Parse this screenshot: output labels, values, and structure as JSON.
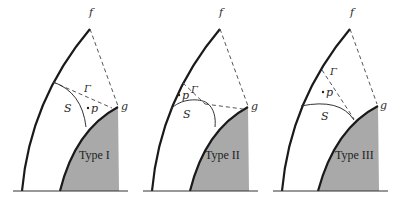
{
  "figure": {
    "panels": [
      {
        "id": "type-1",
        "type_label": "Type I",
        "labels": {
          "f": "f",
          "g": "g",
          "gamma": "Γ",
          "s": "S",
          "p": "p"
        },
        "p_position": "between S and Γ, near g"
      },
      {
        "id": "type-2",
        "type_label": "Type II",
        "labels": {
          "f": "f",
          "g": "g",
          "gamma": "Γ",
          "s": "S",
          "p": "p"
        },
        "p_position": "above S, left of Γ, near outer boundary"
      },
      {
        "id": "type-3",
        "type_label": "Type III",
        "labels": {
          "f": "f",
          "g": "g",
          "gamma": "Γ",
          "s": "S",
          "p": "p"
        },
        "p_position": "above S, left of Γ"
      }
    ],
    "colors": {
      "stroke": "#1a1a1a",
      "dash": "#555555",
      "fill_region": "#a9a9a9",
      "background": "#ffffff"
    }
  }
}
